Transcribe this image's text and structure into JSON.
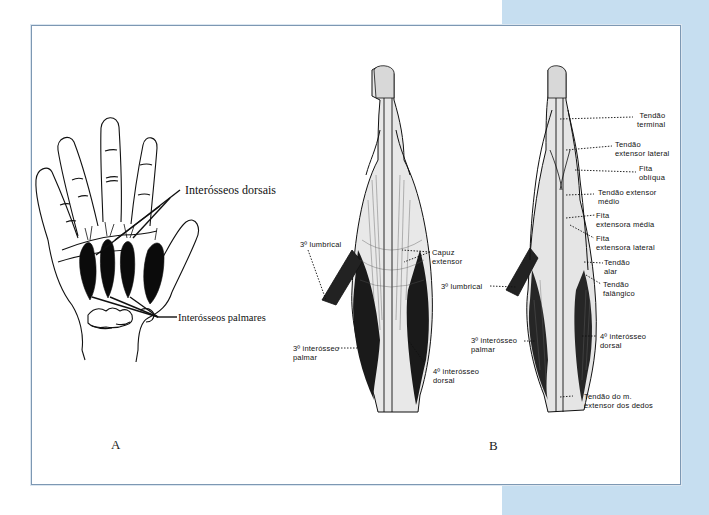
{
  "figure": {
    "panel_color": "#c6def0",
    "frame_border_color": "#7d98b3",
    "part_a": {
      "letter": "A",
      "labels": {
        "dorsal": "Interósseos dorsais",
        "palmar": "Interósseos palmares"
      }
    },
    "part_b": {
      "letter": "B",
      "left_finger_labels": {
        "lumbrical": "3º lumbrical",
        "capuz_line1": "Capuz",
        "capuz_line2": "extensor",
        "palmar_line1": "3º interósseo",
        "palmar_line2": "palmar",
        "dorsal_line1": "4º interósseo",
        "dorsal_line2": "dorsal"
      },
      "right_finger_labels": {
        "terminal_line1": "Tendão",
        "terminal_line2": "terminal",
        "ext_lat_line1": "Tendão",
        "ext_lat_line2": "extensor lateral",
        "obliqua_line1": "Fita",
        "obliqua_line2": "oblíqua",
        "ext_medio_line1": "Tendão extensor",
        "ext_medio_line2": "médio",
        "fita_media_line1": "Fita",
        "fita_media_line2": "extensora média",
        "fita_lateral_line1": "Fita",
        "fita_lateral_line2": "extensora lateral",
        "alar_line1": "Tendão",
        "alar_line2": "alar",
        "falangico_line1": "Tendão",
        "falangico_line2": "falângico",
        "lumbrical": "3º lumbrical",
        "palmar_line1": "3º interósseo",
        "palmar_line2": "palmar",
        "dorsal_line1": "4º interósseo",
        "dorsal_line2": "dorsal",
        "extensor_line1": "Tendão do m.",
        "extensor_line2": "extensor dos dedos"
      }
    }
  }
}
